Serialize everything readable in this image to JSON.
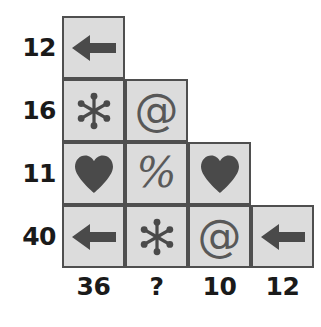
{
  "puzzle": {
    "title": "symbol-weight-grid-puzzle",
    "colors": {
      "cell_fill": "#dcdcdc",
      "cell_border": "#4f4f4f",
      "glyph": "#4a4a4a",
      "label_text": "#1a1a1a",
      "background": "#ffffff"
    },
    "row_labels": [
      {
        "value": "12"
      },
      {
        "value": "16"
      },
      {
        "value": "11"
      },
      {
        "value": "40"
      }
    ],
    "col_labels": [
      {
        "value": "36"
      },
      {
        "value": "?"
      },
      {
        "value": "10"
      },
      {
        "value": "12"
      }
    ],
    "rows": [
      {
        "index": 0,
        "sum_label": "12",
        "cells": [
          {
            "col": 0,
            "symbol": "arrow-left",
            "symbol_name": "left-arrow-icon"
          }
        ]
      },
      {
        "index": 1,
        "sum_label": "16",
        "cells": [
          {
            "col": 0,
            "symbol": "asterisk",
            "symbol_name": "asterisk-star-icon"
          },
          {
            "col": 1,
            "symbol": "at",
            "symbol_name": "at-sign-icon",
            "text": "@"
          }
        ]
      },
      {
        "index": 2,
        "sum_label": "11",
        "cells": [
          {
            "col": 0,
            "symbol": "heart",
            "symbol_name": "heart-icon"
          },
          {
            "col": 1,
            "symbol": "percent",
            "symbol_name": "percent-sign-icon",
            "text": "%"
          },
          {
            "col": 2,
            "symbol": "heart",
            "symbol_name": "heart-icon"
          }
        ]
      },
      {
        "index": 3,
        "sum_label": "40",
        "cells": [
          {
            "col": 0,
            "symbol": "arrow-left",
            "symbol_name": "left-arrow-icon"
          },
          {
            "col": 1,
            "symbol": "asterisk",
            "symbol_name": "asterisk-star-icon"
          },
          {
            "col": 2,
            "symbol": "at",
            "symbol_name": "at-sign-icon",
            "text": "@"
          },
          {
            "col": 3,
            "symbol": "arrow-left",
            "symbol_name": "left-arrow-icon"
          }
        ]
      }
    ]
  }
}
